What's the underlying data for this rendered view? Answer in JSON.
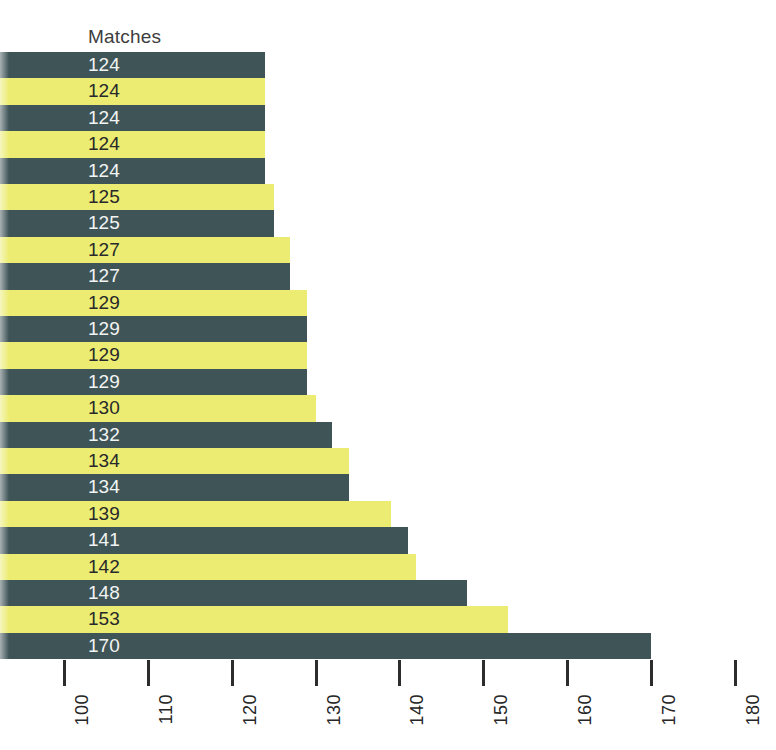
{
  "header": {
    "column_label": "Matches"
  },
  "colors": {
    "bar_dark": "#3f5457",
    "bar_light": "#ecec72",
    "label_on_dark": "#f2f4f3",
    "label_on_light": "#27292b",
    "axis": "#262626",
    "background": "#ffffff"
  },
  "chart_data": {
    "type": "bar",
    "orientation": "horizontal",
    "title": "",
    "subtitle": "",
    "xlabel": "",
    "ylabel": "",
    "value_axis_label": "Matches",
    "categories": [
      "",
      "",
      "",
      "",
      "",
      "",
      "",
      "",
      "",
      "",
      "",
      "",
      "",
      "",
      "",
      "",
      "",
      "",
      "",
      "",
      "",
      "",
      ""
    ],
    "values": [
      124,
      124,
      124,
      124,
      124,
      125,
      125,
      127,
      127,
      129,
      129,
      129,
      129,
      130,
      132,
      134,
      134,
      139,
      141,
      142,
      148,
      153,
      170
    ],
    "data_labels": [
      "124",
      "124",
      "124",
      "124",
      "124",
      "125",
      "125",
      "127",
      "127",
      "129",
      "129",
      "129",
      "129",
      "130",
      "132",
      "134",
      "134",
      "139",
      "141",
      "142",
      "148",
      "153",
      "170"
    ],
    "bar_colors": [
      "dark",
      "light",
      "dark",
      "light",
      "dark",
      "light",
      "dark",
      "light",
      "dark",
      "light",
      "dark",
      "light",
      "dark",
      "light",
      "dark",
      "light",
      "dark",
      "light",
      "dark",
      "light",
      "dark",
      "light",
      "dark"
    ],
    "xlim": [
      100,
      180
    ],
    "axis_start": 100,
    "tick_values": [
      100,
      110,
      120,
      130,
      140,
      150,
      160,
      170,
      180
    ],
    "tick_labels": [
      "100",
      "110",
      "120",
      "130",
      "140",
      "150",
      "160",
      "170",
      "180"
    ],
    "grid": false,
    "legend": false,
    "legend_position": "none",
    "bars_extend_past_left_edge": true
  }
}
